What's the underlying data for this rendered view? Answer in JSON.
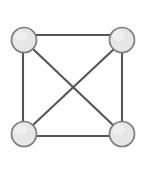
{
  "figure": {
    "type": "graph-diagram",
    "background_color": "#ffffff",
    "width": 168,
    "height": 172
  },
  "style": {
    "node_fill": "#e6e6e6",
    "node_stroke": "#7d7d7d",
    "node_stroke_width": 1.7,
    "node_radius": 12.5,
    "edge_stroke": "#555555",
    "edge_stroke_width": 2.1
  },
  "graph": {
    "name": "K4",
    "node_count": 4,
    "edge_count": 6,
    "nodes": [
      {
        "id": "top-left",
        "label": "",
        "cx": 24,
        "cy": 40
      },
      {
        "id": "top-right",
        "label": "",
        "cx": 122,
        "cy": 40
      },
      {
        "id": "bottom-left",
        "label": "",
        "cx": 24,
        "cy": 134
      },
      {
        "id": "bottom-right",
        "label": "",
        "cx": 122,
        "cy": 134
      }
    ],
    "edges": [
      {
        "id": "edge-top",
        "from": "top-left",
        "to": "top-right",
        "x1": 24,
        "y1": 35,
        "x2": 122,
        "y2": 35
      },
      {
        "id": "edge-left",
        "from": "top-left",
        "to": "bottom-left",
        "x1": 23,
        "y1": 40,
        "x2": 23,
        "y2": 134
      },
      {
        "id": "edge-right",
        "from": "top-right",
        "to": "bottom-right",
        "x1": 122,
        "y1": 40,
        "x2": 122,
        "y2": 134
      },
      {
        "id": "edge-bottom",
        "from": "bottom-left",
        "to": "bottom-right",
        "x1": 24,
        "y1": 136,
        "x2": 122,
        "y2": 136
      },
      {
        "id": "edge-diagonal-main",
        "from": "top-left",
        "to": "bottom-right",
        "x1": 33,
        "y1": 49,
        "x2": 114,
        "y2": 126
      },
      {
        "id": "edge-diagonal-anti",
        "from": "bottom-left",
        "to": "top-right",
        "x1": 33,
        "y1": 125,
        "x2": 114,
        "y2": 49
      }
    ],
    "crossing_point": {
      "x": 73,
      "y": 87
    }
  }
}
